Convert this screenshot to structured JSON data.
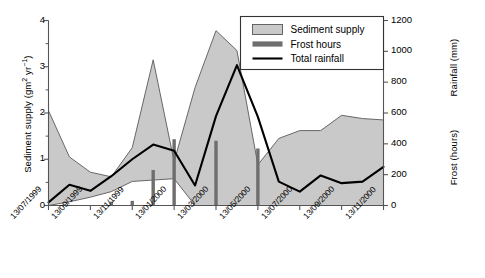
{
  "chart_data": {
    "type": "area",
    "title": "",
    "xlabel": "",
    "ylabel": "Sediment supply (gm2 yr-1)",
    "y2label_upper": "Rainfall (mm)",
    "y2label_lower": "Frost (hours)",
    "grid": false,
    "legend_position": "top-right",
    "x": [
      "13/07/1999",
      "13/08/1999",
      "13/09/1999",
      "13/10/1999",
      "13/11/1999",
      "13/12/1999",
      "13/01/2000",
      "13/02/2000",
      "13/03/2000",
      "13/04/2000",
      "13/05/2000",
      "13/06/2000",
      "13/07/2000",
      "13/08/2000",
      "13/09/2000",
      "13/10/2000",
      "13/11/2000"
    ],
    "xticks": [
      "13/07/1999",
      "13/09/1999",
      "13/11/1999",
      "13/01/2000",
      "13/03/2000",
      "13/05/2000",
      "13/07/2000",
      "13/09/2000",
      "13/11/2000"
    ],
    "ylim": [
      0,
      4
    ],
    "yticks": [
      0,
      1,
      2,
      3,
      4
    ],
    "ytick_labels": [
      "0",
      "1",
      "2",
      "3",
      "4"
    ],
    "y2lim": [
      0,
      1200
    ],
    "y2ticks": [
      0,
      200,
      400,
      600,
      800,
      1000,
      1200
    ],
    "y2tick_labels": [
      "0",
      "200",
      "400",
      "600",
      "800",
      "1000",
      "1200"
    ],
    "series": [
      {
        "name": "Sediment supply",
        "type": "band",
        "axis": "left",
        "color": "#c9c9c9",
        "edge_color": "#595959",
        "upper": [
          2.05,
          1.05,
          0.72,
          0.62,
          1.25,
          3.15,
          0.95,
          2.55,
          3.78,
          3.35,
          0.88,
          1.45,
          1.62,
          1.62,
          1.95,
          1.88,
          1.85
        ],
        "lower": [
          0.0,
          0.08,
          0.18,
          0.3,
          0.52,
          0.55,
          0.58,
          0.0,
          0.0,
          0.0,
          0.0,
          0.0,
          0.0,
          0.0,
          0.0,
          0.0,
          0.0
        ]
      },
      {
        "name": "Frost hours",
        "type": "bar",
        "axis": "right",
        "color": "#6e6e6e",
        "values": [
          0,
          0,
          0,
          25,
          30,
          230,
          430,
          0,
          420,
          0,
          370,
          0,
          0,
          0,
          0,
          0,
          0
        ]
      },
      {
        "name": "Total rainfall",
        "type": "line",
        "axis": "right",
        "color": "#000000",
        "values": [
          20,
          135,
          95,
          190,
          300,
          395,
          355,
          130,
          580,
          910,
          575,
          155,
          90,
          195,
          145,
          155,
          250
        ]
      }
    ],
    "legend": [
      {
        "label": "Sediment supply",
        "swatch": "area-swatch",
        "color": "#c9c9c9"
      },
      {
        "label": "Frost hours",
        "swatch": "bar-swatch",
        "color": "#6e6e6e"
      },
      {
        "label": "Total rainfall",
        "swatch": "line-swatch",
        "color": "#000000"
      }
    ]
  }
}
